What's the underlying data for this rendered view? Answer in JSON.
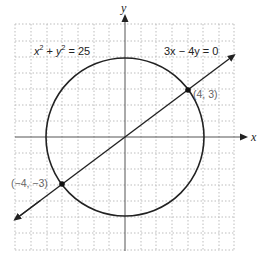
{
  "diagram": {
    "axes": {
      "x_label": "x",
      "y_label": "y"
    },
    "grid": {
      "x_range": [
        -7,
        7
      ],
      "y_range": [
        -7,
        7
      ],
      "step": 1,
      "style": "dotted"
    },
    "circle": {
      "equation": "x² + y² = 25",
      "center": [
        0,
        0
      ],
      "radius": 5
    },
    "line": {
      "equation": "3x − 4y = 0",
      "slope": 0.75
    },
    "intersections": [
      {
        "label": "(4, 3)",
        "x": 4,
        "y": 3
      },
      {
        "label": "(−4, −3)",
        "x": -4,
        "y": -3
      }
    ],
    "labels": {
      "circle_eq_x": "x",
      "circle_eq_rest": " + y",
      "circle_eq_tail": " = 25",
      "sup": "2",
      "line_eq": "3x − 4y = 0",
      "point1": "(4, 3)",
      "point2": "(−4, −3)"
    }
  }
}
